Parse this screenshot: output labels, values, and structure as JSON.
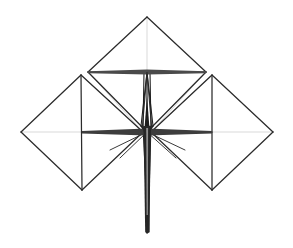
{
  "canvas": {
    "width": 293,
    "height": 248,
    "background": "#ffffff",
    "title": "wireframe-polyhedra-line-drawing"
  },
  "style": {
    "edge_dark": "#2b2b2b",
    "edge_mid": "#4a4a4a",
    "edge_faint": "#c9c9c9",
    "edge_very_faint": "#dedede",
    "stroke_width_heavy": 2.1,
    "stroke_width_normal": 1.15,
    "stroke_width_faint": 0.8
  },
  "figure": {
    "parts": [
      {
        "name": "top-diamond",
        "kind": "rhombus",
        "vertices": {
          "top": [
            147,
            17
          ],
          "left": [
            88,
            72
          ],
          "right": [
            206,
            72
          ],
          "bottom": [
            147,
            132
          ]
        },
        "inner_lines": [
          "top-to-bottom vertical axis",
          "left-to-right horizontal axis"
        ]
      },
      {
        "name": "left-diamond",
        "kind": "rhombus",
        "vertices": {
          "top": [
            81,
            75
          ],
          "left": [
            21,
            132
          ],
          "right": [
            143,
            132
          ],
          "bottom": [
            82,
            190
          ]
        },
        "inner_lines": [
          "top-to-bottom vertical axis",
          "left-to-right horizontal axis"
        ]
      },
      {
        "name": "right-diamond",
        "kind": "rhombus",
        "vertices": {
          "top": [
            212,
            75
          ],
          "left": [
            151,
            132
          ],
          "right": [
            273,
            132
          ],
          "bottom": [
            212,
            190
          ]
        },
        "inner_lines": [
          "top-to-bottom vertical axis",
          "left-to-right horizontal axis"
        ]
      },
      {
        "name": "central-spindle",
        "kind": "narrow-rhombus",
        "vertices": {
          "top": [
            147,
            72
          ],
          "left": [
            141,
            126
          ],
          "right": [
            153,
            126
          ],
          "bottom": [
            147,
            135
          ]
        }
      },
      {
        "name": "lower-spike",
        "kind": "tapering-needle",
        "vertices": {
          "top_left": [
            143,
            126
          ],
          "top_right": [
            151,
            126
          ],
          "tip": [
            148,
            232
          ]
        }
      }
    ]
  },
  "geometry": {
    "heavy_edges": [
      [
        147,
        17,
        88,
        72
      ],
      [
        147,
        17,
        206,
        72
      ],
      [
        88,
        72,
        147,
        132
      ],
      [
        206,
        72,
        147,
        132
      ],
      [
        88,
        72,
        206,
        72
      ],
      [
        81,
        75,
        21,
        132
      ],
      [
        81,
        75,
        143,
        132
      ],
      [
        21,
        132,
        82,
        190
      ],
      [
        143,
        132,
        82,
        190
      ],
      [
        81,
        75,
        82,
        190
      ],
      [
        212,
        75,
        151,
        132
      ],
      [
        212,
        75,
        273,
        132
      ],
      [
        151,
        132,
        212,
        190
      ],
      [
        273,
        132,
        212,
        190
      ],
      [
        212,
        75,
        212,
        190
      ],
      [
        82,
        132,
        212,
        132
      ]
    ],
    "faint_edges": [
      [
        147,
        17,
        147,
        132
      ],
      [
        21,
        132,
        143,
        132
      ],
      [
        151,
        132,
        273,
        132
      ],
      [
        88,
        72,
        147,
        132
      ],
      [
        206,
        72,
        147,
        132
      ],
      [
        81,
        75,
        143,
        132
      ],
      [
        212,
        75,
        151,
        132
      ],
      [
        88,
        72,
        143,
        132
      ],
      [
        206,
        72,
        151,
        132
      ]
    ],
    "spindle_edges": [
      [
        147,
        72,
        141,
        126
      ],
      [
        147,
        72,
        153,
        126
      ],
      [
        141,
        126,
        147,
        135
      ],
      [
        153,
        126,
        147,
        135
      ],
      [
        147,
        72,
        147,
        135
      ],
      [
        144,
        72,
        143,
        130
      ],
      [
        150,
        72,
        151,
        130
      ]
    ],
    "spike_edges": [
      [
        143,
        126,
        148,
        232
      ],
      [
        151,
        126,
        148,
        232
      ],
      [
        146,
        126,
        147,
        232
      ],
      [
        149,
        126,
        149,
        232
      ]
    ],
    "base_fan_edges": [
      [
        147,
        132,
        110,
        150
      ],
      [
        147,
        132,
        185,
        150
      ],
      [
        147,
        132,
        120,
        158
      ],
      [
        147,
        132,
        176,
        158
      ]
    ]
  }
}
